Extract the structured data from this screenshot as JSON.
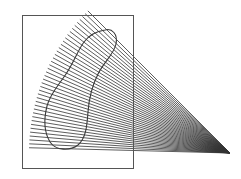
{
  "diagram": {
    "width": 241,
    "height": 179,
    "background": "#ffffff",
    "stroke_color": "#2a2a2a",
    "rectangle": {
      "x": 22,
      "y": 15,
      "width": 111,
      "height": 153,
      "stroke": "#555555"
    },
    "fan": {
      "focal_point": [
        230,
        153
      ],
      "radius": 201,
      "start_angle_deg": 178.5,
      "end_angle_deg": 135,
      "ray_count": 40,
      "stroke": "#333333"
    },
    "blob": {
      "path": "M105,30 C112,28 118,34 116,44 C114,54 104,62 98,74 C92,86 89,98 88,112 C87,126 86,138 78,145 C70,151 56,151 50,142 C44,132 44,118 47,106 C50,94 58,86 66,74 C74,62 78,50 84,42 C90,34 98,31 105,30 Z",
      "stroke": "#3a3a3a"
    }
  }
}
